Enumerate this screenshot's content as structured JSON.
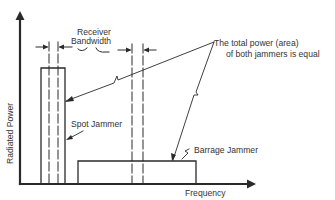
{
  "diagram": {
    "axes": {
      "x_label": "Frequency",
      "y_label": "Radiated Power"
    },
    "labels": {
      "receiver_line1": "Receiver",
      "receiver_line2": "Bandwidth",
      "note_line1": "The total power (area)",
      "note_line2": "of both jammers is equal",
      "spot_jammer": "Spot Jammer",
      "barrage_jammer": "Barrage Jammer"
    },
    "colors": {
      "line": "#2a2a2a",
      "text": "#333333",
      "background": "#ffffff"
    }
  }
}
